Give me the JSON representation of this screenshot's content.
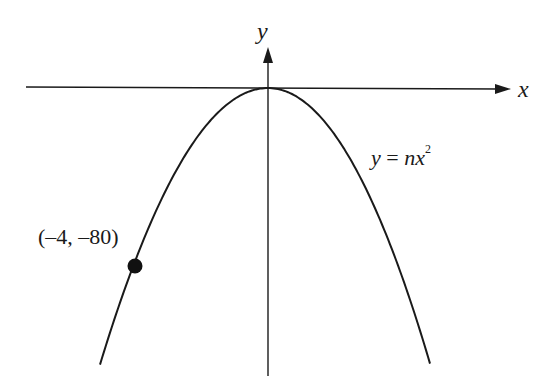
{
  "diagram": {
    "type": "parabola-graph",
    "equation_label": {
      "lhs": "y",
      "eq": " = ",
      "coef": "n",
      "var": "x",
      "exp": "2"
    },
    "x_axis_label": "x",
    "y_axis_label": "y",
    "point_label": "(–4, –80)",
    "point": {
      "x": -4,
      "y": -80
    },
    "colors": {
      "stroke": "#1a1a1a",
      "background": "#ffffff"
    }
  },
  "chart_data": {
    "type": "line",
    "title": "",
    "xlabel": "x",
    "ylabel": "y",
    "series": [
      {
        "name": "y = nx^2",
        "function": "y = n x^2",
        "vertex": [
          0,
          0
        ],
        "opens": "down"
      }
    ],
    "annotations": [
      {
        "text": "(–4, –80)",
        "x": -4,
        "y": -80
      }
    ],
    "grid": false
  }
}
